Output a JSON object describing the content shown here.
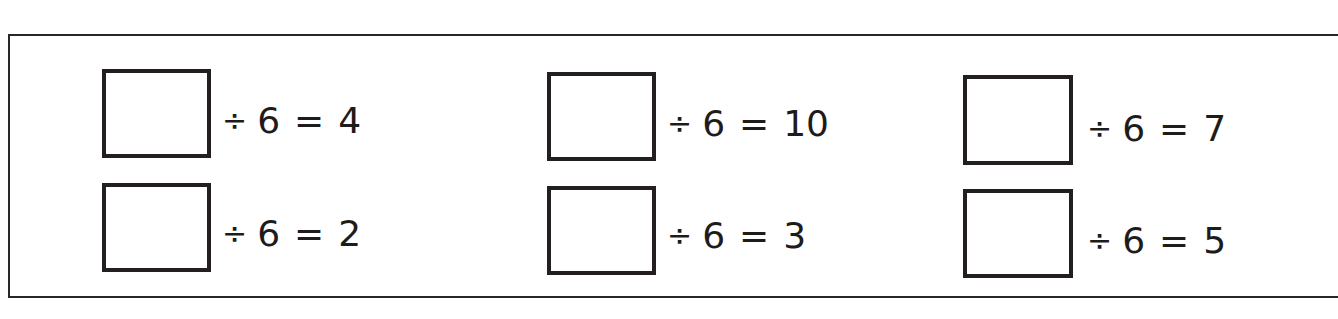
{
  "worksheet": {
    "operator_symbol": "÷",
    "equals_symbol": "=",
    "divisor": "6",
    "problems": [
      {
        "id": "r1c1",
        "row": 1,
        "column": 1,
        "answer": "",
        "divisor": "6",
        "quotient": "4"
      },
      {
        "id": "r1c2",
        "row": 1,
        "column": 2,
        "answer": "",
        "divisor": "6",
        "quotient": "10"
      },
      {
        "id": "r1c3",
        "row": 1,
        "column": 3,
        "answer": "",
        "divisor": "6",
        "quotient": "7"
      },
      {
        "id": "r2c1",
        "row": 2,
        "column": 1,
        "answer": "",
        "divisor": "6",
        "quotient": "2"
      },
      {
        "id": "r2c2",
        "row": 2,
        "column": 2,
        "answer": "",
        "divisor": "6",
        "quotient": "3"
      },
      {
        "id": "r2c3",
        "row": 2,
        "column": 3,
        "answer": "",
        "divisor": "6",
        "quotient": "5"
      }
    ]
  },
  "colors": {
    "ink": "#1e1b1b",
    "background": "#ffffff"
  }
}
